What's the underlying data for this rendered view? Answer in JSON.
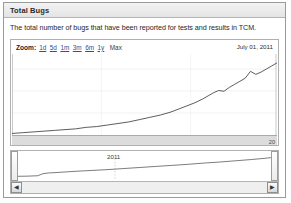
{
  "panel": {
    "title": "Total Bugs",
    "description": "The total number of bugs that have been reported for tests and results in TCM."
  },
  "chart_controls": {
    "zoom_label": "Zoom:",
    "ranges": [
      {
        "label": "1d",
        "active": false
      },
      {
        "label": "5d",
        "active": false
      },
      {
        "label": "1m",
        "active": false
      },
      {
        "label": "3m",
        "active": false
      },
      {
        "label": "6m",
        "active": false
      },
      {
        "label": "1y",
        "active": false
      },
      {
        "label": "Max",
        "active": true
      }
    ],
    "current_date": "July 01, 2011"
  },
  "navigator": {
    "year_label": "2011",
    "scroll_left_icon": "◀",
    "scroll_right_icon": "▶"
  },
  "colors": {
    "line": "#4a4a4a",
    "link": "#2a4fa8",
    "axis_strip": "#dcdcdc",
    "panel_border": "#9a9a9a"
  },
  "chart_data": {
    "type": "line",
    "title": "Total Bugs",
    "subtitle": "The total number of bugs that have been reported for tests and results in TCM.",
    "xlabel": "",
    "ylabel": "",
    "grid": true,
    "legend": false,
    "x_end_tick": "20",
    "series": [
      {
        "name": "Total Bugs",
        "x": [
          0,
          4,
          8,
          12,
          16,
          20,
          24,
          28,
          32,
          36,
          40,
          44,
          48,
          52,
          56,
          60,
          63,
          66,
          69,
          72,
          74,
          76,
          78,
          80,
          82,
          84,
          86,
          88,
          90,
          92,
          94,
          96,
          98,
          100
        ],
        "values": [
          2,
          3,
          4,
          5,
          6,
          7,
          8,
          10,
          11,
          13,
          15,
          17,
          20,
          23,
          26,
          30,
          34,
          38,
          42,
          47,
          51,
          55,
          58,
          57,
          62,
          66,
          70,
          74,
          83,
          79,
          82,
          86,
          90,
          94
        ]
      }
    ],
    "navigator_series": [
      {
        "name": "Total Bugs (overview)",
        "x": [
          0,
          6,
          10,
          12,
          14,
          18,
          24,
          30,
          36,
          42,
          48,
          54,
          60,
          66,
          72,
          78,
          84,
          90,
          96,
          100
        ],
        "values": [
          3,
          4,
          6,
          16,
          19,
          22,
          27,
          31,
          35,
          40,
          45,
          50,
          55,
          60,
          66,
          71,
          77,
          83,
          90,
          96
        ]
      }
    ]
  }
}
